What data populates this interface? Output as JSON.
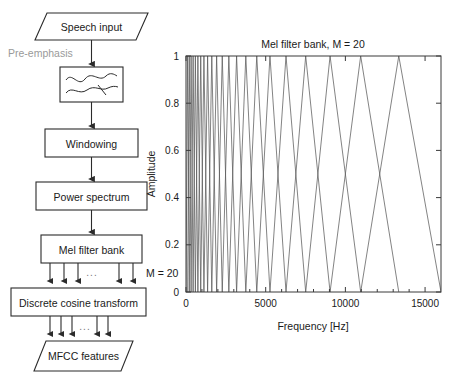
{
  "flowchart": {
    "name": "mfcc-extraction-flowchart",
    "nodes": [
      {
        "id": "speech-input",
        "label": "Speech input",
        "shape": "parallelogram"
      },
      {
        "id": "pre-emphasis",
        "label": "Pre-emphasis",
        "shape": "side-label",
        "color": "#9a9a9a"
      },
      {
        "id": "filter-box",
        "label": "",
        "shape": "rect-waveform"
      },
      {
        "id": "windowing",
        "label": "Windowing",
        "shape": "rect"
      },
      {
        "id": "power-spectrum",
        "label": "Power spectrum",
        "shape": "rect"
      },
      {
        "id": "mel-filter-bank",
        "label": "Mel filter bank",
        "shape": "rect"
      },
      {
        "id": "dct",
        "label": "Discrete cosine transform",
        "shape": "rect"
      },
      {
        "id": "mfcc-features",
        "label": "MFCC features",
        "shape": "parallelogram"
      }
    ],
    "bus_label_m": "M = 20",
    "ellipsis": "...",
    "bus_arrow_count": 5
  },
  "chart_data": {
    "type": "line",
    "title": "Mel filter bank, M = 20",
    "xlabel": "Frequency [Hz]",
    "ylabel": "Amplitude",
    "xlim": [
      0,
      16000
    ],
    "ylim": [
      0,
      1
    ],
    "xticks": [
      0,
      5000,
      10000,
      15000
    ],
    "xticklabels": [
      "0",
      "5000",
      "10000",
      "15000"
    ],
    "yticks": [
      0,
      0.2,
      0.4,
      0.6,
      0.8,
      1
    ],
    "yticklabels": [
      "0",
      "0.2",
      "0.4",
      "0.6",
      "0.8",
      "1"
    ],
    "grid": false,
    "legend": null,
    "n_filters": 20,
    "peak_amplitude": 1,
    "series_description": "20 triangular mel-spaced band-pass filters, each rising from its lower edge to amplitude 1 at its centre then falling to its upper edge",
    "filters": [
      {
        "index": 1,
        "left": 0,
        "center": 100,
        "right": 205
      },
      {
        "index": 2,
        "left": 100,
        "center": 205,
        "right": 320
      },
      {
        "index": 3,
        "left": 205,
        "center": 320,
        "right": 447
      },
      {
        "index": 4,
        "left": 320,
        "center": 447,
        "right": 588
      },
      {
        "index": 5,
        "left": 447,
        "center": 588,
        "right": 746
      },
      {
        "index": 6,
        "left": 588,
        "center": 746,
        "right": 924
      },
      {
        "index": 7,
        "left": 746,
        "center": 924,
        "right": 1125
      },
      {
        "index": 8,
        "left": 924,
        "center": 1125,
        "right": 1355
      },
      {
        "index": 9,
        "left": 1125,
        "center": 1355,
        "right": 1618
      },
      {
        "index": 10,
        "left": 1355,
        "center": 1618,
        "right": 1922
      },
      {
        "index": 11,
        "left": 1618,
        "center": 1922,
        "right": 2275
      },
      {
        "index": 12,
        "left": 1922,
        "center": 2275,
        "right": 2688
      },
      {
        "index": 13,
        "left": 2275,
        "center": 2688,
        "right": 3175
      },
      {
        "index": 14,
        "left": 2688,
        "center": 3175,
        "right": 3752
      },
      {
        "index": 15,
        "left": 3175,
        "center": 3752,
        "right": 4440
      },
      {
        "index": 16,
        "left": 3752,
        "center": 4440,
        "right": 5268
      },
      {
        "index": 17,
        "left": 4440,
        "center": 5268,
        "right": 6275
      },
      {
        "index": 18,
        "left": 5268,
        "center": 6275,
        "right": 7510
      },
      {
        "index": 19,
        "left": 6275,
        "center": 7510,
        "right": 9040
      },
      {
        "index": 20,
        "left": 7510,
        "center": 9040,
        "right": 10960
      },
      {
        "index": 21,
        "left": 9040,
        "center": 10960,
        "right": 13350
      },
      {
        "index": 22,
        "left": 10960,
        "center": 13350,
        "right": 16000
      }
    ]
  }
}
